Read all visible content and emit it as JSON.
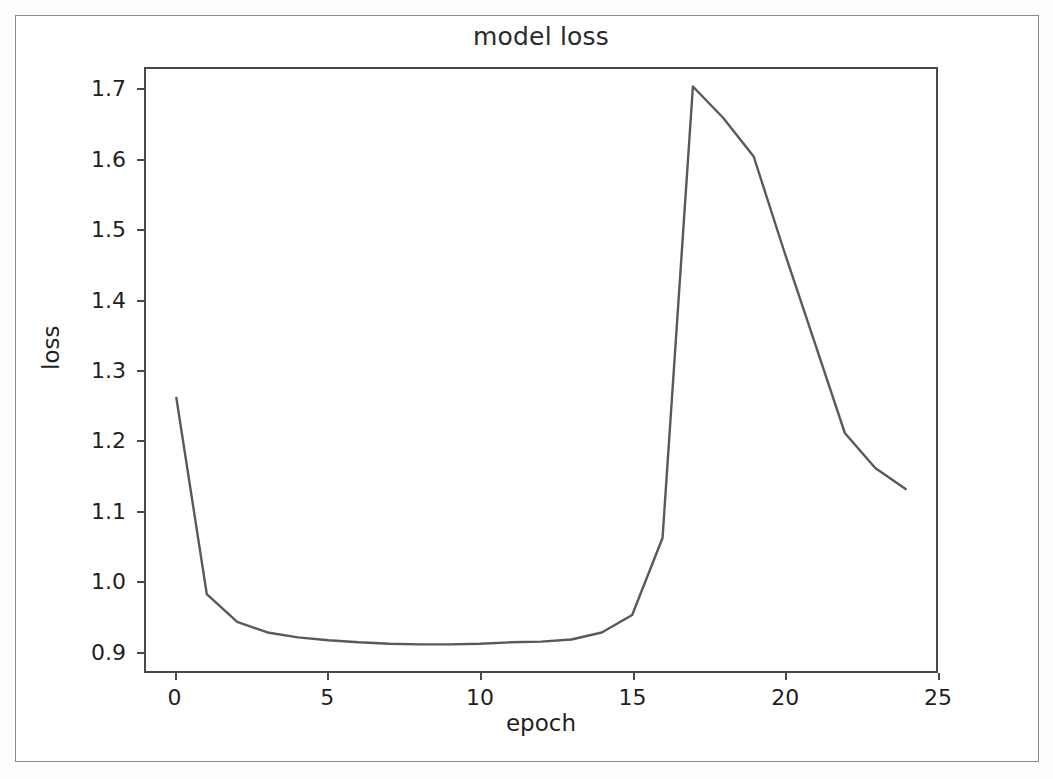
{
  "figure": {
    "title": "model loss",
    "xlabel": "epoch",
    "ylabel": "loss",
    "line_color": "#595959",
    "axis_color": "#4a4a4a",
    "background": "#ffffff"
  },
  "axes": {
    "y_ticks": [
      "0.9",
      "1.0",
      "1.1",
      "1.2",
      "1.3",
      "1.4",
      "1.5",
      "1.6",
      "1.7"
    ],
    "x_ticks": [
      "0",
      "5",
      "10",
      "15",
      "20",
      "25"
    ]
  },
  "chart_data": {
    "type": "line",
    "title": "model loss",
    "xlabel": "epoch",
    "ylabel": "loss",
    "xlim": [
      -1,
      25
    ],
    "ylim": [
      0.87,
      1.73
    ],
    "grid": false,
    "legend": null,
    "x": [
      0,
      1,
      2,
      3,
      4,
      5,
      6,
      7,
      8,
      9,
      10,
      11,
      12,
      13,
      14,
      15,
      16,
      17,
      18,
      19,
      20,
      21,
      22,
      23,
      24
    ],
    "series": [
      {
        "name": "loss",
        "color": "#595959",
        "values": [
          1.26,
          0.98,
          0.94,
          0.925,
          0.918,
          0.914,
          0.911,
          0.909,
          0.908,
          0.908,
          0.909,
          0.911,
          0.912,
          0.915,
          0.925,
          0.95,
          1.06,
          1.705,
          1.66,
          1.605,
          1.47,
          1.34,
          1.21,
          1.16,
          1.13
        ]
      }
    ]
  }
}
